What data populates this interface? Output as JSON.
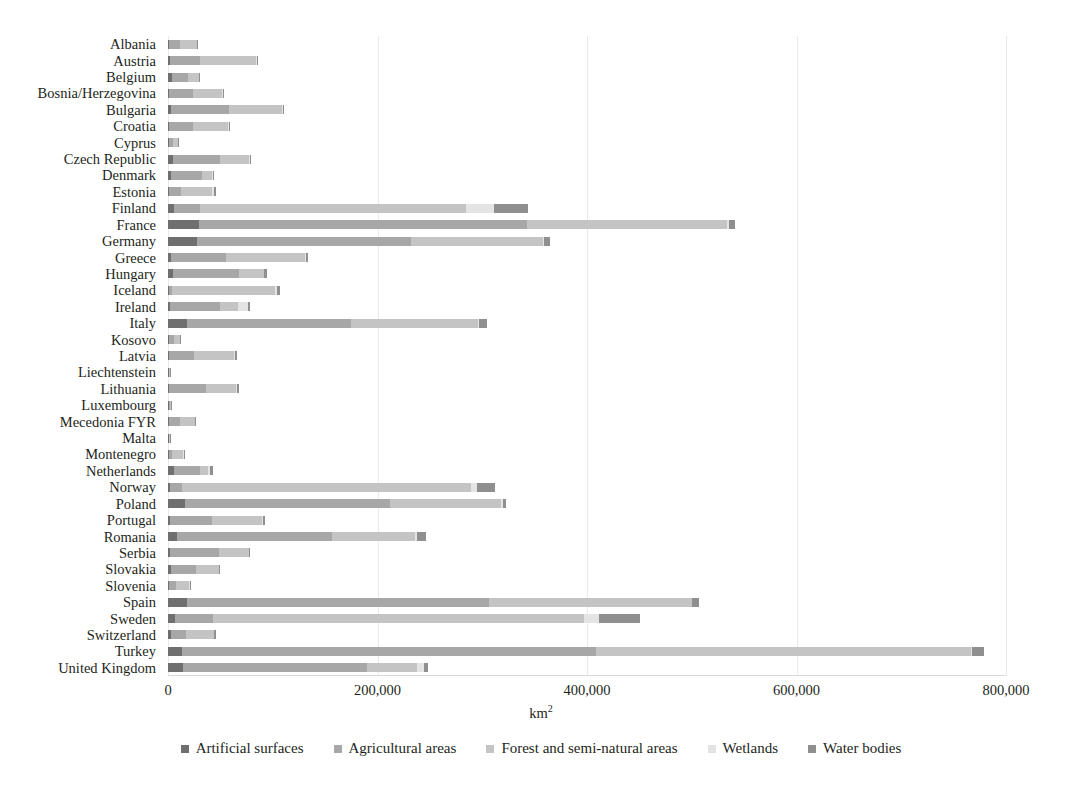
{
  "chart_data": {
    "type": "bar",
    "orientation": "horizontal",
    "stacked": true,
    "title": "",
    "xlabel": "km²",
    "ylabel": "",
    "xlim": [
      0,
      800000
    ],
    "xticks": [
      0,
      200000,
      400000,
      600000,
      800000
    ],
    "xtick_labels": [
      "0",
      "200,000",
      "400,000",
      "600,000",
      "800,000"
    ],
    "grid": true,
    "grid_axis": "x",
    "legend_position": "bottom",
    "categories": [
      "Albania",
      "Austria",
      "Belgium",
      "Bosnia/Herzegovina",
      "Bulgaria",
      "Croatia",
      "Cyprus",
      "Czech Republic",
      "Denmark",
      "Estonia",
      "Finland",
      "France",
      "Germany",
      "Greece",
      "Hungary",
      "Iceland",
      "Ireland",
      "Italy",
      "Kosovo",
      "Latvia",
      "Liechtenstein",
      "Lithuania",
      "Luxembourg",
      "Mecedonia FYR",
      "Malta",
      "Montenegro",
      "Netherlands",
      "Norway",
      "Poland",
      "Portugal",
      "Romania",
      "Serbia",
      "Slovakia",
      "Slovenia",
      "Spain",
      "Sweden",
      "Switzerland",
      "Turkey",
      "United Kingdom"
    ],
    "series": [
      {
        "name": "Artificial surfaces",
        "color": "#6f6f70",
        "values": [
          500,
          2300,
          3400,
          900,
          3100,
          1300,
          500,
          4500,
          3100,
          1100,
          5500,
          30000,
          28000,
          2800,
          4500,
          300,
          1800,
          18000,
          200,
          1300,
          10,
          1100,
          200,
          700,
          100,
          200,
          5800,
          2100,
          16000,
          2200,
          8200,
          2000,
          2500,
          700,
          18000,
          6500,
          2600,
          13000,
          14000
        ]
      },
      {
        "name": "Agricultural areas",
        "color": "#a7a7a8",
        "values": [
          11000,
          28000,
          16000,
          23000,
          55000,
          23000,
          4400,
          45000,
          29000,
          11000,
          25000,
          313000,
          204000,
          53000,
          63000,
          3300,
          48000,
          157000,
          5200,
          24000,
          60,
          35000,
          1400,
          11000,
          110,
          3000,
          25000,
          11000,
          196000,
          40000,
          148000,
          47000,
          24000,
          6500,
          288000,
          36000,
          15000,
          396000,
          176000
        ]
      },
      {
        "name": "Forest and semi-natural areas",
        "color": "#c4c4c5",
        "values": [
          16000,
          54000,
          10000,
          28000,
          51000,
          33000,
          4500,
          28000,
          10000,
          30000,
          254000,
          191000,
          126000,
          75000,
          24000,
          98000,
          17000,
          121000,
          5400,
          38000,
          100,
          29000,
          1100,
          14000,
          180,
          11000,
          7000,
          276000,
          106000,
          48000,
          80000,
          28000,
          22000,
          13000,
          194000,
          355000,
          26000,
          358000,
          48000
        ]
      },
      {
        "name": "Wetlands",
        "color": "#e4e4e5",
        "values": [
          100,
          100,
          400,
          100,
          200,
          200,
          30,
          100,
          600,
          2000,
          27000,
          2000,
          800,
          200,
          300,
          2000,
          10000,
          300,
          0,
          900,
          0,
          200,
          0,
          100,
          0,
          100,
          2000,
          6000,
          1600,
          600,
          2000,
          200,
          100,
          100,
          700,
          14000,
          100,
          1000,
          6000
        ]
      },
      {
        "name": "Water bodies",
        "color": "#8f8f90",
        "values": [
          700,
          600,
          900,
          400,
          1100,
          500,
          200,
          1100,
          800,
          2200,
          32000,
          5000,
          6000,
          2000,
          2000,
          3000,
          1500,
          8000,
          100,
          1800,
          10,
          1900,
          100,
          500,
          20,
          400,
          3500,
          17000,
          2800,
          2300,
          8000,
          1000,
          900,
          200,
          6000,
          39000,
          1400,
          11000,
          4000
        ]
      }
    ]
  },
  "legend": {
    "items": [
      {
        "label": "Artificial surfaces",
        "color": "#6f6f70"
      },
      {
        "label": "Agricultural areas",
        "color": "#a7a7a8"
      },
      {
        "label": "Forest and semi-natural areas",
        "color": "#c4c4c5"
      },
      {
        "label": "Wetlands",
        "color": "#e4e4e5"
      },
      {
        "label": "Water bodies",
        "color": "#8f8f90"
      }
    ]
  },
  "axis": {
    "x_title": "km",
    "x_title_sup": "2"
  }
}
